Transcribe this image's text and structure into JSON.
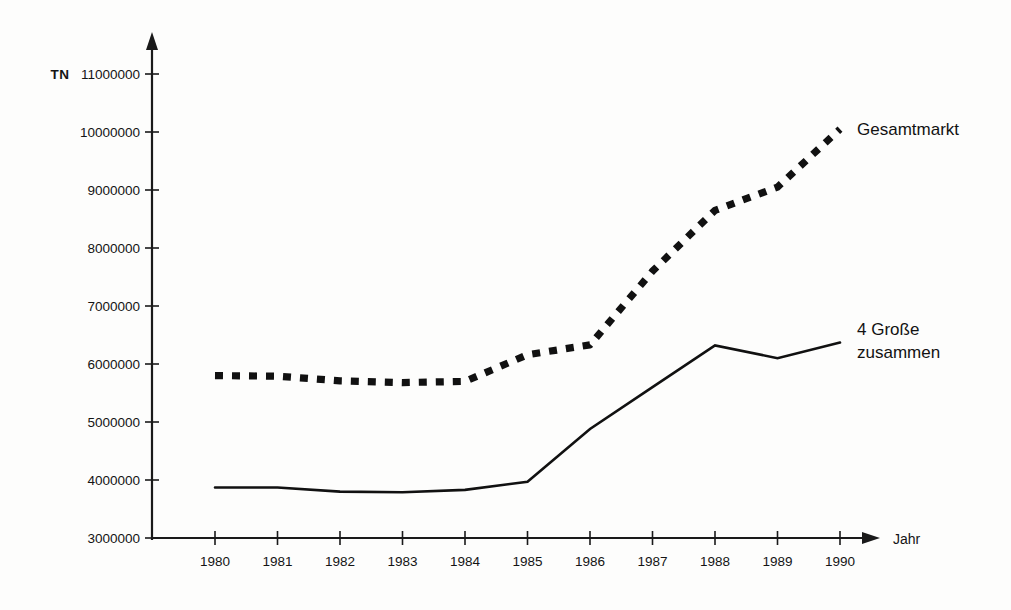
{
  "chart_data": {
    "type": "line",
    "title": "",
    "xlabel": "Jahr",
    "ylabel": "TN",
    "grid": false,
    "legend_position": "inline-right",
    "x": [
      1980,
      1981,
      1982,
      1983,
      1984,
      1985,
      1986,
      1987,
      1988,
      1989,
      1990
    ],
    "categories": [
      "1980",
      "1981",
      "1982",
      "1983",
      "1984",
      "1985",
      "1986",
      "1987",
      "1988",
      "1989",
      "1990"
    ],
    "xlim": [
      1980,
      1990
    ],
    "ylim": [
      3000000,
      11000000
    ],
    "yticks": [
      3000000,
      4000000,
      5000000,
      6000000,
      7000000,
      8000000,
      9000000,
      10000000,
      11000000
    ],
    "ytick_labels": [
      "3000000",
      "4000000",
      "5000000",
      "6000000",
      "7000000",
      "8000000",
      "9000000",
      "10000000",
      "11000000"
    ],
    "series": [
      {
        "name": "Gesamtmarkt",
        "style": "dashed",
        "color": "#111111",
        "label_line1": "Gesamtmarkt",
        "label_line2": "",
        "values": [
          5800000,
          5790000,
          5710000,
          5680000,
          5700000,
          6160000,
          6330000,
          7600000,
          8650000,
          9050000,
          10050000
        ]
      },
      {
        "name": "4 Große zusammen",
        "style": "solid",
        "color": "#111111",
        "label_line1": "4 Große",
        "label_line2": "zusammen",
        "values": [
          3870000,
          3870000,
          3800000,
          3790000,
          3830000,
          3970000,
          4880000,
          5600000,
          6320000,
          6100000,
          6370000
        ]
      }
    ]
  },
  "axis": {
    "y_unit": "TN",
    "x_name": "Jahr"
  }
}
